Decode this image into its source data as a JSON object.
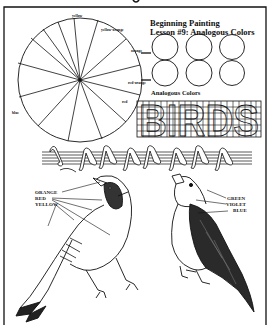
{
  "worksheet": {
    "title_line1": "Beginning Painting",
    "title_line2": "Lesson #9:  Analogous Colors",
    "analogous_caption": "Analogous Colors",
    "grid_word": "BIRDS"
  },
  "color_wheel": {
    "segments": 14,
    "labels": [
      "yellow",
      "yellow-orange",
      "orange",
      "red-orange",
      "red",
      "blue"
    ]
  },
  "analogous_circles": {
    "rows": 2,
    "columns": 3,
    "count": 6
  },
  "music_staff": {
    "lines": 5,
    "notes": 8
  },
  "left_bird": {
    "labels": [
      "ORANGE",
      "RED",
      "YELLOW"
    ]
  },
  "right_bird": {
    "labels": [
      "GREEN",
      "VIOLET",
      "BLUE"
    ]
  },
  "colors": {
    "ink": "#111111",
    "paper": "#ffffff"
  }
}
